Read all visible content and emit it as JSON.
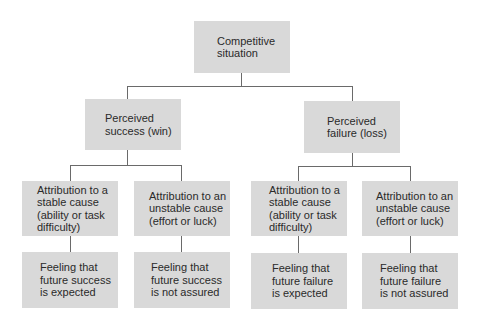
{
  "diagram": {
    "type": "tree",
    "root": {
      "label": "Competitive\nsituation"
    },
    "level2": [
      {
        "label": "Perceived\nsuccess (win)"
      },
      {
        "label": "Perceived\nfailure (loss)"
      }
    ],
    "level3": [
      {
        "label": "Attribution to a\nstable cause\n(ability or task\ndifficulty)"
      },
      {
        "label": "Attribution to an\nunstable cause\n(effort or luck)"
      },
      {
        "label": "Attribution to a\nstable cause\n(ability or task\ndifficulty)"
      },
      {
        "label": "Attribution to an\nunstable cause\n(effort or luck)"
      }
    ],
    "level4": [
      {
        "label": "Feeling that\nfuture success\nis expected"
      },
      {
        "label": "Feeling that\nfuture success\nis not assured"
      },
      {
        "label": "Feeling that\nfuture failure\nis expected"
      },
      {
        "label": "Feeling that\nfuture failure\nis not assured"
      }
    ],
    "colors": {
      "box_fill": "#d9d9d9",
      "connector": "#6a6a6a",
      "text": "#2a2a2a",
      "background": "#ffffff"
    }
  }
}
